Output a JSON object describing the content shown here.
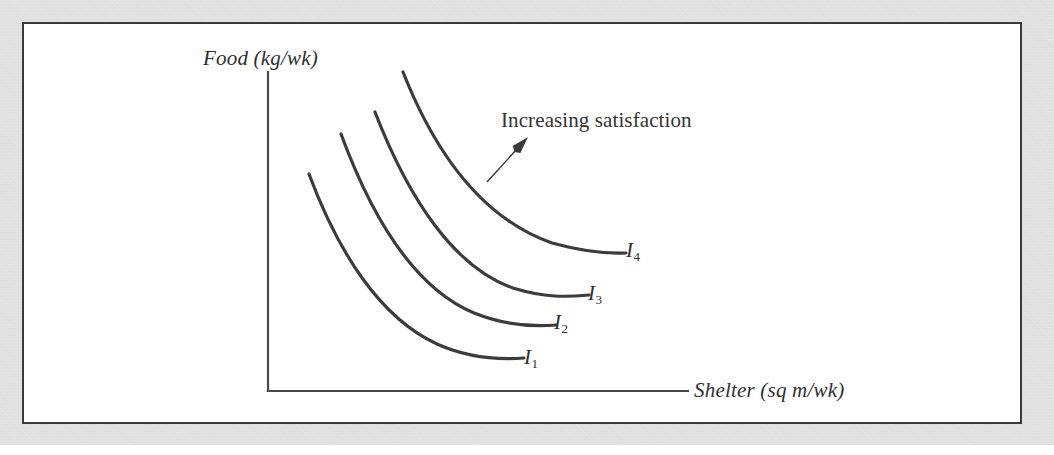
{
  "figure": {
    "background_color": "#ffffff",
    "mat_color": "#d6d6d6",
    "panel_border_color": "#3b3b3b"
  },
  "chart_data": {
    "type": "line",
    "title": "",
    "subtitle": "",
    "xlabel": "Shelter (sq m/wk)",
    "ylabel": "Food (kg/wk)",
    "xlim": [
      0,
      10
    ],
    "ylim": [
      0,
      10
    ],
    "grid": false,
    "legend_position": "inline-end-of-curve",
    "axis_ticks": [],
    "tick_labels": [],
    "curve_color": "#3c3c3c",
    "axis_color": "#4a4a4a",
    "annotations": [
      {
        "text": "Increasing satisfaction",
        "x": 501,
        "y": 108,
        "arrow_from": [
          487,
          182
        ],
        "arrow_to": [
          528,
          137
        ],
        "arrow_direction": "up-right"
      }
    ],
    "series": [
      {
        "name": "I1",
        "label": "I",
        "subscript": "1",
        "utility_rank": 1,
        "path": "M 309 174 C 338 252, 380 318, 437 344 C 468 358, 497 360, 524 358",
        "points": [
          [
            309,
            174
          ],
          [
            330,
            235
          ],
          [
            360,
            295
          ],
          [
            400,
            330
          ],
          [
            450,
            350
          ],
          [
            524,
            358
          ]
        ]
      },
      {
        "name": "I2",
        "label": "I",
        "subscript": "2",
        "utility_rank": 2,
        "path": "M 341 134 C 372 218, 414 288, 474 313 C 504 325, 531 327, 556 325",
        "points": [
          [
            341,
            134
          ],
          [
            364,
            200
          ],
          [
            396,
            262
          ],
          [
            436,
            298
          ],
          [
            486,
            318
          ],
          [
            556,
            325
          ]
        ]
      },
      {
        "name": "I3",
        "label": "I",
        "subscript": "3",
        "utility_rank": 3,
        "path": "M 375 112 C 409 200, 455 268, 513 288 C 545 298, 567 297, 589 295",
        "points": [
          [
            375,
            112
          ],
          [
            400,
            182
          ],
          [
            434,
            244
          ],
          [
            474,
            276
          ],
          [
            524,
            292
          ],
          [
            589,
            295
          ]
        ]
      },
      {
        "name": "I4",
        "label": "I",
        "subscript": "4",
        "utility_rank": 4,
        "path": "M 403 72 C 441 168, 492 222, 552 243 C 585 252, 606 254, 626 253",
        "points": [
          [
            403,
            72
          ],
          [
            432,
            150
          ],
          [
            468,
            202
          ],
          [
            510,
            230
          ],
          [
            562,
            247
          ],
          [
            626,
            253
          ]
        ]
      }
    ],
    "axes": {
      "origin": [
        268,
        391
      ],
      "y_axis_top": [
        268,
        72
      ],
      "x_axis_right": [
        688,
        391
      ]
    }
  }
}
